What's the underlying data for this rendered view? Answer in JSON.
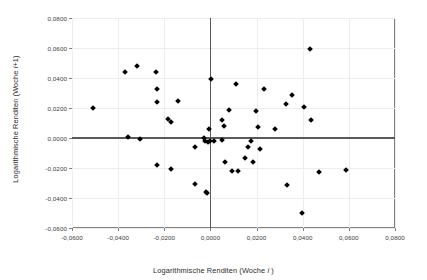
{
  "chart_data": {
    "type": "scatter",
    "title": "",
    "xlabel": "Logarithmische Renditen (Woche i )",
    "ylabel": "Logarithmische Renditen (Woche i+1)",
    "xlabel_prefix": "Logarithmische Renditen (Woche ",
    "xlabel_italic": "i",
    "xlabel_suffix": " )",
    "ylabel_prefix": "Logarithmische Renditen (Woche ",
    "ylabel_italic": "i",
    "ylabel_suffix": "+1)",
    "xlim": [
      -0.06,
      0.08
    ],
    "ylim": [
      -0.06,
      0.08
    ],
    "xticks": [
      -0.06,
      -0.04,
      -0.02,
      0.0,
      0.02,
      0.04,
      0.06,
      0.08
    ],
    "yticks": [
      -0.06,
      -0.04,
      -0.02,
      0.0,
      0.02,
      0.04,
      0.06,
      0.08
    ],
    "xtick_labels": [
      "-0,0600",
      "-0,0400",
      "-0,0200",
      "0,0000",
      "0,0200",
      "0,0400",
      "0,0600",
      "0,0800"
    ],
    "ytick_labels": [
      "-0,0600",
      "-0,0400",
      "-0,0200",
      "0,0000",
      "0,0200",
      "0,0400",
      "0,0600",
      "0,0800"
    ],
    "grid": true,
    "legend": false,
    "marker": "diamond",
    "marker_color": "#000000",
    "grid_color": "#ededed",
    "frame_color": "#808080",
    "zeroline_color": "#595959",
    "points": [
      [
        -0.051,
        0.02
      ],
      [
        -0.0372,
        0.0438
      ],
      [
        -0.0358,
        0.0008
      ],
      [
        -0.032,
        0.0478
      ],
      [
        -0.0307,
        -0.0008
      ],
      [
        -0.0235,
        0.0443
      ],
      [
        -0.0232,
        0.0328
      ],
      [
        -0.0233,
        0.0239
      ],
      [
        -0.0231,
        -0.0181
      ],
      [
        -0.0186,
        0.0128
      ],
      [
        -0.017,
        0.011
      ],
      [
        -0.0172,
        -0.0204
      ],
      [
        -0.014,
        0.0249
      ],
      [
        -0.0065,
        -0.0057
      ],
      [
        -0.0068,
        -0.0307
      ],
      [
        -0.0028,
        0.0
      ],
      [
        -0.0022,
        -0.0022
      ],
      [
        -0.0018,
        -0.0358
      ],
      [
        -0.0014,
        -0.0366
      ],
      [
        -0.001,
        -0.0025
      ],
      [
        -0.0006,
        0.006
      ],
      [
        -0.0004,
        -0.002
      ],
      [
        0.0002,
        0.0396
      ],
      [
        0.0016,
        -0.0018
      ],
      [
        0.0048,
        0.012
      ],
      [
        0.0052,
        -0.0012
      ],
      [
        0.0058,
        0.0082
      ],
      [
        0.0064,
        -0.0158
      ],
      [
        0.0082,
        0.019
      ],
      [
        0.0094,
        -0.0218
      ],
      [
        0.0112,
        0.0357
      ],
      [
        0.012,
        -0.0222
      ],
      [
        0.015,
        -0.0134
      ],
      [
        0.0165,
        -0.0058
      ],
      [
        0.0178,
        -0.0018
      ],
      [
        0.0184,
        -0.0157
      ],
      [
        0.0196,
        0.0178
      ],
      [
        0.0207,
        0.0076
      ],
      [
        0.0213,
        -0.007
      ],
      [
        0.0232,
        0.0328
      ],
      [
        0.0281,
        0.0062
      ],
      [
        0.0326,
        0.0226
      ],
      [
        0.033,
        -0.031
      ],
      [
        0.0352,
        0.0288
      ],
      [
        0.0398,
        -0.0501
      ],
      [
        0.0404,
        0.021
      ],
      [
        0.0432,
        0.0595
      ],
      [
        0.0436,
        0.0122
      ],
      [
        0.047,
        -0.0224
      ],
      [
        0.0588,
        -0.0216
      ]
    ]
  },
  "plot_geometry": {
    "left": 72,
    "top": 18,
    "right": 395,
    "bottom": 228
  }
}
